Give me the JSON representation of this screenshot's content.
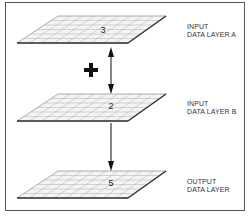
{
  "diagram": {
    "type": "layer-overlay",
    "layers": [
      {
        "id": "a",
        "title_line1": "INPUT",
        "title_line2": "DATA LAYER A",
        "cell_value": "3"
      },
      {
        "id": "b",
        "title_line1": "INPUT",
        "title_line2": "DATA LAYER B",
        "cell_value": "2"
      },
      {
        "id": "out",
        "title_line1": "OUTPUT",
        "title_line2": "DATA LAYER",
        "cell_value": "5"
      }
    ],
    "operator": "+",
    "colors": {
      "grid_line": "#9a9a9a",
      "grid_edge": "#333333",
      "arrow": "#111111",
      "frame": "#555555"
    }
  }
}
